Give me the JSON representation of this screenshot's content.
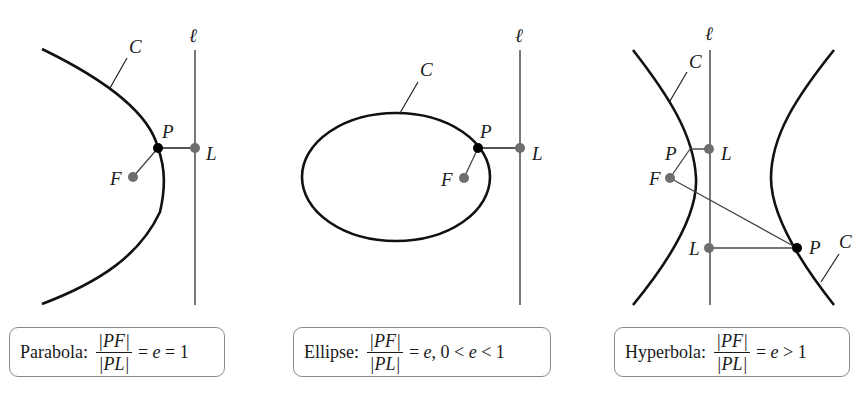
{
  "figure": {
    "panels": [
      {
        "id": "parabola",
        "labels": {
          "curve": "C",
          "directrix": "ℓ",
          "point": "P",
          "focus": "F",
          "foot": "L"
        },
        "caption": {
          "name": "Parabola:",
          "numerator": "|PF|",
          "denominator": "|PL|",
          "relation_pre": "= ",
          "e": "e",
          "relation_post": " = 1"
        }
      },
      {
        "id": "ellipse",
        "labels": {
          "curve": "C",
          "directrix": "ℓ",
          "point": "P",
          "focus": "F",
          "foot": "L"
        },
        "caption": {
          "name": "Ellipse:",
          "numerator": "|PF|",
          "denominator": "|PL|",
          "relation_pre": "= ",
          "e": "e",
          "relation_post": ", 0 < ",
          "e2": "e",
          "relation_post2": " < 1"
        }
      },
      {
        "id": "hyperbola",
        "labels": {
          "curve": "C",
          "curve2": "C",
          "directrix": "ℓ",
          "point": "P",
          "point2": "P",
          "focus": "F",
          "foot": "L",
          "foot2": "L"
        },
        "caption": {
          "name": "Hyperbola:",
          "numerator": "|PF|",
          "denominator": "|PL|",
          "relation_pre": "= ",
          "e": "e",
          "relation_post": " > 1"
        }
      }
    ],
    "colors": {
      "curve": "#111111",
      "directrix": "#555555",
      "point_P": "#000000",
      "point_F_L": "#6e6e6e",
      "segments": "#444444",
      "caption_border": "#8a8a8a"
    }
  }
}
